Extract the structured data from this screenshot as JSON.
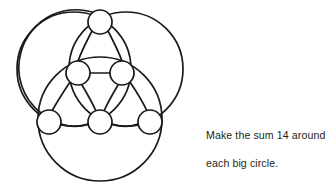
{
  "page": {
    "background_color": "#ffffff",
    "width": 334,
    "height": 193
  },
  "instruction": {
    "line1": "Make the sum 14 around",
    "line2": "each big circle.",
    "full_text": "Make the sum 14 around each big circle.",
    "target_sum": 14,
    "text_color": "#231f20"
  },
  "diagram": {
    "name": "three-overlapping-circles-puzzle",
    "stroke_color": "#1a1a1a",
    "fill_color": "#ffffff",
    "big_circle_count": 3,
    "small_circle_count": 9,
    "big_circles": [
      {
        "id": "big-circle-upper-left",
        "cx": 74,
        "cy": 69,
        "r": 57
      },
      {
        "id": "big-circle-upper-right",
        "cx": 126,
        "cy": 69,
        "r": 57
      },
      {
        "id": "big-circle-bottom",
        "cx": 100,
        "cy": 119,
        "r": 62
      }
    ],
    "small_circles": [
      {
        "id": "node-top",
        "label": "",
        "cx": 100,
        "cy": 22,
        "r": 12
      },
      {
        "id": "node-inner-left",
        "label": "",
        "cx": 78,
        "cy": 73,
        "r": 12
      },
      {
        "id": "node-inner-right",
        "label": "",
        "cx": 122,
        "cy": 73,
        "r": 12
      },
      {
        "id": "node-bottom-left",
        "label": "",
        "cx": 49,
        "cy": 122,
        "r": 12
      },
      {
        "id": "node-bottom-mid",
        "label": "",
        "cx": 100,
        "cy": 122,
        "r": 12
      },
      {
        "id": "node-bottom-right",
        "label": "",
        "cx": 150,
        "cy": 122,
        "r": 12
      }
    ]
  }
}
